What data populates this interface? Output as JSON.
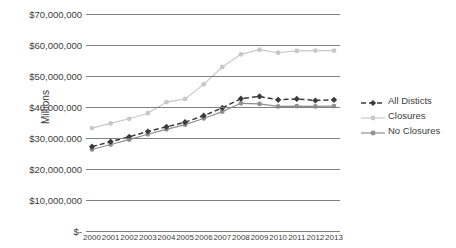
{
  "chart_data": {
    "type": "line",
    "title": "",
    "xlabel": "",
    "ylabel": "Millions",
    "categories": [
      "2000",
      "2001",
      "2002",
      "2003",
      "2004",
      "2005",
      "2006",
      "2007",
      "2008",
      "2009",
      "2010",
      "2011",
      "2012",
      "2013"
    ],
    "ylim": [
      0,
      70000000
    ],
    "yticks": [
      {
        "value": 70000000,
        "label": "$70,000,000"
      },
      {
        "value": 60000000,
        "label": "$60,000,000"
      },
      {
        "value": 50000000,
        "label": "$50,000,000"
      },
      {
        "value": 40000000,
        "label": "$40,000,000"
      },
      {
        "value": 30000000,
        "label": "$30,000,000"
      },
      {
        "value": 20000000,
        "label": "$20,000,000"
      },
      {
        "value": 10000000,
        "label": "$10,000,000"
      },
      {
        "value": 0,
        "label": "$-"
      }
    ],
    "grid": true,
    "legend_position": "right",
    "series": [
      {
        "name": "All Disticts",
        "color": "#3a3a3a",
        "style": "dashed",
        "marker": "diamond",
        "values": [
          27200000,
          28800000,
          30400000,
          32100000,
          33600000,
          35100000,
          37200000,
          39700000,
          42700000,
          43400000,
          42300000,
          42600000,
          42100000,
          42300000
        ]
      },
      {
        "name": "Closures",
        "color": "#c8c8c8",
        "style": "solid",
        "marker": "circle",
        "values": [
          33200000,
          34700000,
          36200000,
          38000000,
          41600000,
          42600000,
          47300000,
          52900000,
          57000000,
          58500000,
          57500000,
          58100000,
          58200000,
          58200000
        ]
      },
      {
        "name": "No Closures",
        "color": "#909090",
        "style": "solid",
        "marker": "circle",
        "values": [
          26300000,
          27900000,
          29500000,
          31200000,
          32800000,
          34300000,
          36300000,
          38500000,
          41200000,
          41000000,
          40200000,
          40300000,
          40200000,
          40300000
        ]
      }
    ]
  }
}
